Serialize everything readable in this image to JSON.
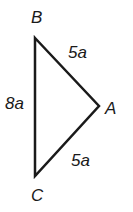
{
  "diagram": {
    "type": "triangle",
    "vertices": [
      {
        "name": "B",
        "x": 35,
        "y": 38,
        "label_x": 31,
        "label_y": 23
      },
      {
        "name": "A",
        "x": 99,
        "y": 106,
        "label_x": 105,
        "label_y": 114
      },
      {
        "name": "C",
        "x": 35,
        "y": 176,
        "label_x": 31,
        "label_y": 201
      }
    ],
    "sides": [
      {
        "name": "BA",
        "length": "5a",
        "label_x": 68,
        "label_y": 58
      },
      {
        "name": "BC",
        "length": "8a",
        "label_x": 5,
        "label_y": 109
      },
      {
        "name": "AC",
        "length": "5a",
        "label_x": 71,
        "label_y": 166
      }
    ],
    "stroke_color": "#1a1a1a"
  }
}
